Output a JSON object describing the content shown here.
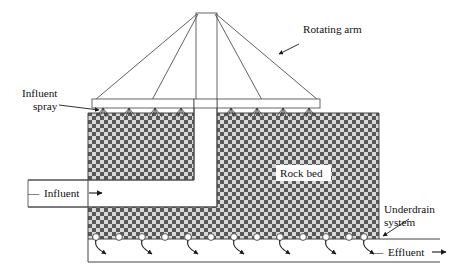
{
  "figure": {
    "background_color": "#ffffff",
    "labels": {
      "rotating_arm": "Rotating arm",
      "influent_spray_line1": "Influent",
      "influent_spray_line2": "spray",
      "rock_bed": "Rock bed",
      "influent": "Influent",
      "underdrain_line1": "Underdrain",
      "underdrain_line2": "system",
      "effluent": "Effluent",
      "influent_dash": "—",
      "influent_arrow": "→",
      "effluent_dash": "—",
      "effluent_arrow": "→"
    },
    "colors": {
      "media_dark": "#5a5a5a",
      "media_light": "#ffffff",
      "line": "#444444",
      "text": "#111111",
      "arrow": "#1a1a1a"
    },
    "components": [
      {
        "name": "rotating-arm-mast",
        "type": "vertical-mast"
      },
      {
        "name": "guy-wires",
        "type": "cables",
        "count": 4
      },
      {
        "name": "distributor-arm",
        "type": "horizontal-bar"
      },
      {
        "name": "spray-nozzles",
        "type": "nozzle-array",
        "count": 8
      },
      {
        "name": "rock-bed-media",
        "type": "filter-media"
      },
      {
        "name": "influent-channel",
        "type": "pipe"
      },
      {
        "name": "underdrain-system",
        "type": "drain-plenum"
      },
      {
        "name": "underdrain-ports",
        "type": "orifice-array",
        "count": 13
      },
      {
        "name": "effluent-channel",
        "type": "pipe"
      }
    ],
    "spray_nozzle_x": [
      103,
      129,
      155,
      181,
      231,
      257,
      283,
      309
    ],
    "underdrain_port_x": [
      96,
      119,
      142,
      165,
      188,
      211,
      234,
      257,
      280,
      303,
      326,
      349,
      362
    ],
    "underdrain_arrow_x": [
      98,
      144,
      190,
      236,
      282,
      328,
      360
    ]
  }
}
